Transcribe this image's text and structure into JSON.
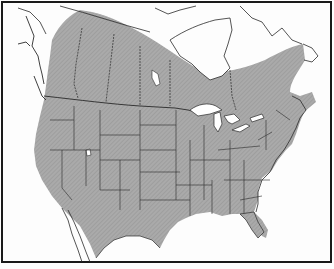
{
  "map": {
    "type": "species-range-map",
    "region": "North America",
    "style": "black-and-white line map with hatched gray range shading",
    "colors": {
      "background": "#fdfdfd",
      "range_fill": "#a9a9a9",
      "range_hatch": "#8f8f8f",
      "boundary_lines": "#2a2a2a",
      "water": "#ffffff",
      "frame": "#1a1a1a"
    },
    "shaded_range": "Most of the contiguous United States and southern/central Canada, extending north into the boreal region and Labrador; excludes arctic Canada, Alaska panhandle coast, Baja California and northern Mexico",
    "features": [
      "state-borders",
      "province-borders",
      "great-lakes",
      "international-border",
      "frame"
    ]
  }
}
